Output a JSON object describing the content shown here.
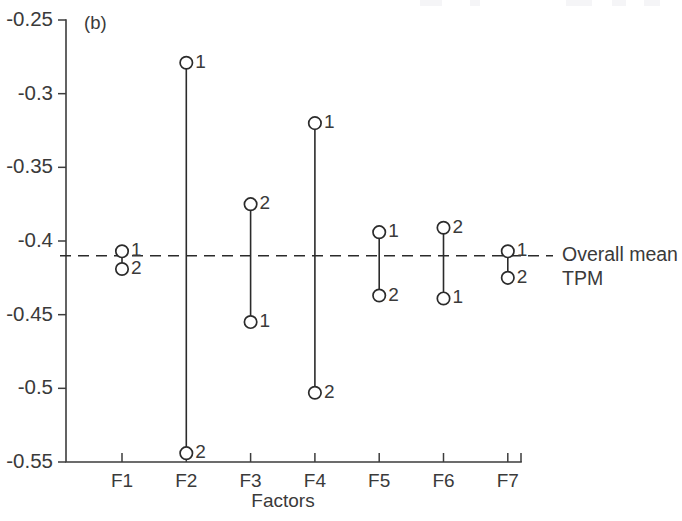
{
  "figure": {
    "panel_label": "(b)",
    "xlabel": "Factors",
    "mean_label_line1": "Overall mean",
    "mean_label_line2": "TPM",
    "colors": {
      "ink": "#2b2b2b",
      "axis": "#3d3d3d",
      "background": "#ffffff"
    }
  },
  "chart_data": {
    "type": "line",
    "title": "",
    "subtitle": "",
    "panel": "(b)",
    "xlabel": "Factors",
    "ylabel": "",
    "categories": [
      "F1",
      "F2",
      "F3",
      "F4",
      "F5",
      "F6",
      "F7"
    ],
    "xtick_labels": [
      "F1",
      "F2",
      "F3",
      "F4",
      "F5",
      "F6",
      "F7"
    ],
    "ytick_labels": [
      "-0.25",
      "-0.3",
      "-0.35",
      "-0.4",
      "-0.45",
      "-0.5",
      "-0.55"
    ],
    "ytick_values": [
      -0.25,
      -0.3,
      -0.35,
      -0.4,
      -0.45,
      -0.5,
      -0.55
    ],
    "ylim": [
      -0.55,
      -0.25
    ],
    "grid": false,
    "legend": false,
    "legend_position": "none",
    "annotations": [
      {
        "text": "Overall mean TPM",
        "kind": "reference-line-label",
        "value": -0.41
      }
    ],
    "reference_line": {
      "label": "Overall mean TPM",
      "value": -0.41,
      "style": "dashed"
    },
    "marker_style": "open-circle",
    "series": [
      {
        "name": "Level 1",
        "point_label": "1",
        "values": [
          -0.407,
          -0.279,
          -0.455,
          -0.32,
          -0.394,
          -0.439,
          -0.407
        ]
      },
      {
        "name": "Level 2",
        "point_label": "2",
        "values": [
          -0.419,
          -0.544,
          -0.375,
          -0.503,
          -0.437,
          -0.391,
          -0.425
        ]
      }
    ],
    "points": [
      {
        "factor": "F1",
        "level": "1",
        "value": -0.407,
        "label_side": "right"
      },
      {
        "factor": "F1",
        "level": "2",
        "value": -0.419,
        "label_side": "right"
      },
      {
        "factor": "F2",
        "level": "1",
        "value": -0.279,
        "label_side": "right"
      },
      {
        "factor": "F2",
        "level": "2",
        "value": -0.544,
        "label_side": "right"
      },
      {
        "factor": "F3",
        "level": "2",
        "value": -0.375,
        "label_side": "right"
      },
      {
        "factor": "F3",
        "level": "1",
        "value": -0.455,
        "label_side": "right"
      },
      {
        "factor": "F4",
        "level": "1",
        "value": -0.32,
        "label_side": "right"
      },
      {
        "factor": "F4",
        "level": "2",
        "value": -0.503,
        "label_side": "right"
      },
      {
        "factor": "F5",
        "level": "1",
        "value": -0.394,
        "label_side": "right"
      },
      {
        "factor": "F5",
        "level": "2",
        "value": -0.437,
        "label_side": "right"
      },
      {
        "factor": "F6",
        "level": "2",
        "value": -0.391,
        "label_side": "right"
      },
      {
        "factor": "F6",
        "level": "1",
        "value": -0.439,
        "label_side": "right"
      },
      {
        "factor": "F7",
        "level": "1",
        "value": -0.407,
        "label_side": "right"
      },
      {
        "factor": "F7",
        "level": "2",
        "value": -0.425,
        "label_side": "right"
      }
    ]
  }
}
